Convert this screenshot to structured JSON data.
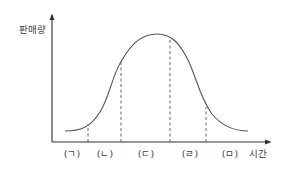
{
  "diagram": {
    "type": "product-life-cycle",
    "y_axis_label": "판매량",
    "x_axis_label": "시간",
    "stages": [
      {
        "label": "(ㄱ)",
        "x": 70
      },
      {
        "label": "(ㄴ)",
        "x": 105
      },
      {
        "label": "(ㄷ)",
        "x": 146
      },
      {
        "label": "(ㄹ)",
        "x": 190
      },
      {
        "label": "(ㅁ)",
        "x": 226
      }
    ],
    "dividers_x": [
      88,
      121,
      170,
      206
    ],
    "colors": {
      "axis": "#333333",
      "curve": "#555555",
      "divider": "#555555",
      "text": "#444444"
    }
  }
}
